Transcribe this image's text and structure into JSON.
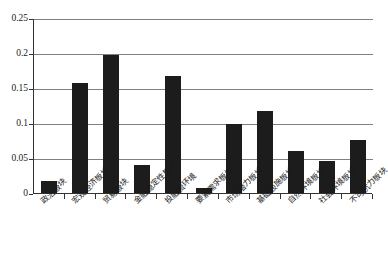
{
  "chart_data": {
    "type": "bar",
    "title": "",
    "xlabel": "",
    "ylabel": "",
    "ylim": [
      0,
      0.25
    ],
    "yticks": [
      "0",
      "0.05",
      "0.1",
      "0.15",
      "0.2",
      "0.25"
    ],
    "ytick_values": [
      0,
      0.05,
      0.1,
      0.15,
      0.2,
      0.25
    ],
    "grid": true,
    "legend": "none",
    "categories": [
      "政治板块",
      "宏观经济板块",
      "贸易板块",
      "金融稳定性板块",
      "投融资环境",
      "要素需求板块",
      "市场潜力板块",
      "基础设施板块",
      "自然环境板块",
      "社会环境板块",
      "不可抗力板块"
    ],
    "values": [
      0.017,
      0.157,
      0.197,
      0.04,
      0.167,
      0.007,
      0.098,
      0.117,
      0.06,
      0.046,
      0.076
    ],
    "bar_color": "#1c1c1c",
    "grid_color": "#808080",
    "axis_color": "#333333"
  }
}
